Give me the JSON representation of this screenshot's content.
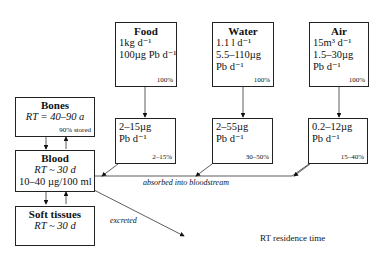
{
  "sources": [
    {
      "title": "Food",
      "lines": [
        "1kg d⁻¹",
        "100µg Pb d⁻¹"
      ],
      "pct": "100%"
    },
    {
      "title": "Water",
      "lines": [
        "1.1 l d⁻¹",
        "5.5–110µg",
        "Pb d⁻¹"
      ],
      "pct": "100%"
    },
    {
      "title": "Air",
      "lines": [
        "15m³ d⁻¹",
        "1.5–30µg",
        "Pb d⁻¹"
      ],
      "pct": "100%"
    }
  ],
  "absorbed": [
    {
      "lines": [
        "2–15µg",
        "Pb d⁻¹"
      ],
      "pct": "2–15%"
    },
    {
      "lines": [
        "2–55µg",
        "Pb d⁻¹"
      ],
      "pct": "30–50%"
    },
    {
      "lines": [
        "0.2–12µg",
        "Pb d⁻¹"
      ],
      "pct": "15–40%"
    }
  ],
  "bones": {
    "title": "Bones",
    "rt": "RT = 40–90 a",
    "note": "90% stored"
  },
  "blood": {
    "title": "Blood",
    "rt": "RT ~ 30 d",
    "conc": "10–40 µg/100 ml"
  },
  "soft_tissues": {
    "title": "Soft tissues",
    "rt": "RT ~ 30 d"
  },
  "labels": {
    "absorbed": "absorbed into bloodstream",
    "excreted": "excreted",
    "legend": "RT residence time"
  }
}
